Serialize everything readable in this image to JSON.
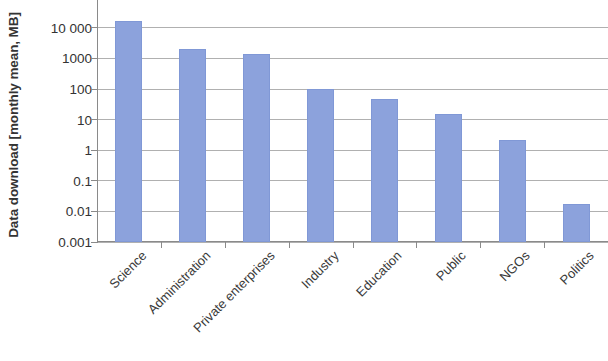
{
  "chart_data": {
    "type": "bar",
    "title": "",
    "subtitle": "",
    "xlabel": "",
    "ylabel": "Data download [monthly mean, MB]",
    "categories": [
      "Science",
      "Administration",
      "Private enterprises",
      "Industry",
      "Education",
      "Public",
      "NGOs",
      "Politics"
    ],
    "values": [
      17000,
      2100,
      1400,
      100,
      47,
      15,
      2.1,
      0.018
    ],
    "series": [
      {
        "name": "Data download",
        "values": [
          17000,
          2100,
          1400,
          100,
          47,
          15,
          2.1,
          0.018
        ]
      }
    ],
    "yscale": "log",
    "ylim": [
      0.001,
      40000
    ],
    "ytick_labels": [
      "10 000",
      "1000",
      "100",
      "10",
      "1",
      "0.1",
      "0.01",
      "0.001"
    ],
    "ytick_values": [
      10000,
      1000,
      100,
      10,
      1,
      0.1,
      0.01,
      0.001
    ],
    "grid": true,
    "grid_axis": "y",
    "legend": false,
    "legend_position": "none",
    "bar_color": "#8ca2dc",
    "gridline_color": "#b0b0b0",
    "axis_color": "#8a8a8a",
    "text_color": "#333333",
    "xtick_label_rotation": -45
  }
}
